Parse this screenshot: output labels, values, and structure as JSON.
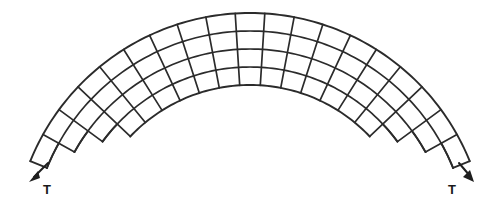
{
  "figure": {
    "background_color": "#ffffff",
    "line_color": "#2b2b2b",
    "arrow_color": "#1e1e1e"
  },
  "labels": {
    "left_force": "T",
    "right_force": "T"
  },
  "chart_data": {
    "type": "diagram",
    "geometry": {
      "shape": "circular annulus sector",
      "center_x": 250,
      "center_y": 250,
      "inner_radius": 165,
      "outer_radius": 237,
      "start_angle_deg": 202,
      "end_angle_deg": 338,
      "radial_rows": 4,
      "angular_columns": 19,
      "end_step_columns": 3
    },
    "forces": [
      {
        "name": "left_tension",
        "label": "T",
        "tail_x": 48,
        "tail_y": 163,
        "tip_x": 31,
        "tip_y": 180,
        "direction_deg": 225,
        "label_x": 48,
        "label_y": 192
      },
      {
        "name": "right_tension",
        "label": "T",
        "tail_x": 459,
        "tail_y": 163,
        "tip_x": 472,
        "tip_y": 180,
        "direction_deg": 315,
        "label_x": 452,
        "label_y": 192
      }
    ]
  }
}
